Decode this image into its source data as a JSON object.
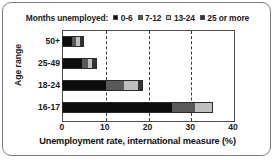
{
  "chart_data": {
    "type": "bar",
    "orientation": "horizontal",
    "stacked": true,
    "title": "",
    "xlabel": "Unemployment rate, international measure (%)",
    "ylabel": "Age range",
    "xlim": [
      0,
      40
    ],
    "xticks": [
      0,
      10,
      20,
      30,
      40
    ],
    "xticklabels": [
      "0",
      "10",
      "20",
      "30",
      "40"
    ],
    "grid": "vertical-dashed",
    "legend_title": "Months unemployed:",
    "legend_position": "top-center",
    "categories": [
      "50+",
      "25-49",
      "18-24",
      "16-17"
    ],
    "series": [
      {
        "name": "0-6",
        "color": "#0d0d0d",
        "values": [
          2.3,
          4.7,
          10.3,
          25.7
        ]
      },
      {
        "name": "7-12",
        "color": "#595959",
        "values": [
          1.0,
          1.3,
          4.2,
          5.4
        ]
      },
      {
        "name": "13-24",
        "color": "#bfbfbf",
        "values": [
          1.0,
          1.0,
          3.3,
          4.2
        ]
      },
      {
        "name": "25 or more",
        "color": "#333333",
        "values": [
          0.9,
          1.2,
          1.2,
          0.0
        ]
      }
    ],
    "totals": [
      5.2,
      8.2,
      19.0,
      35.3
    ]
  },
  "legend": {
    "title": "Months unemployed:",
    "items": [
      {
        "label": "0-6",
        "color": "#0d0d0d"
      },
      {
        "label": "7-12",
        "color": "#595959"
      },
      {
        "label": "13-24",
        "color": "#bfbfbf"
      },
      {
        "label": "25 or more",
        "color": "#333333"
      }
    ]
  },
  "axes": {
    "y_title": "Age range",
    "y_ticks": [
      "50+",
      "25-49",
      "18-24",
      "16-17"
    ],
    "x_title": "Unemployment rate, international measure (%)",
    "x_ticks": [
      "0",
      "10",
      "20",
      "30",
      "40"
    ]
  }
}
